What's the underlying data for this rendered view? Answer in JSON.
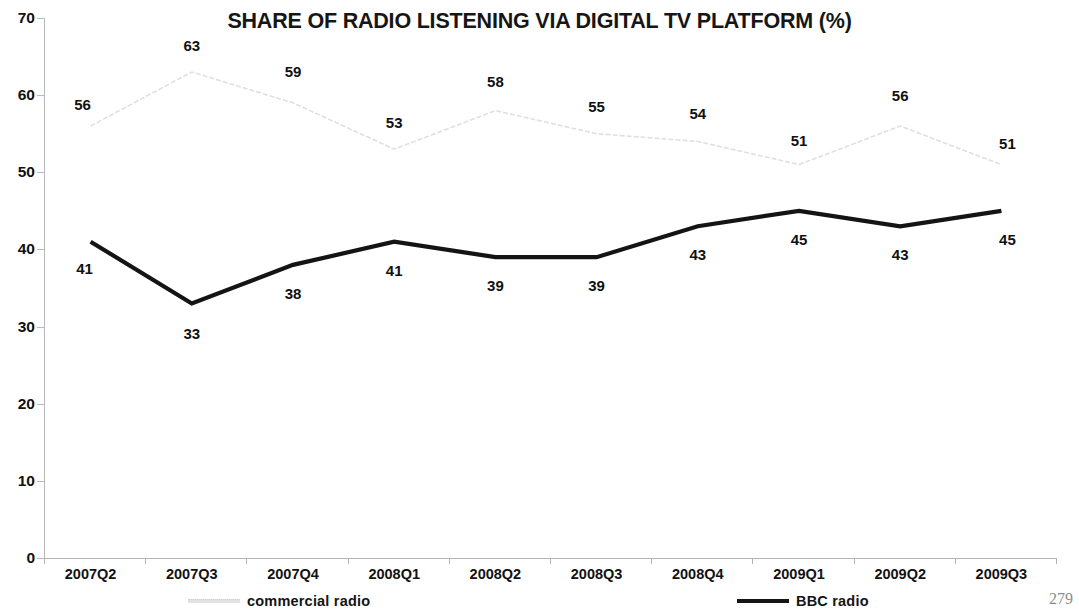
{
  "page_number": "279",
  "legend": {
    "position": "bottom",
    "entries": [
      {
        "label": "commercial radio",
        "style": "dotted-light",
        "color": "#e0e0e0"
      },
      {
        "label": "BBC radio",
        "style": "solid-thick",
        "color": "#141414"
      }
    ]
  },
  "chart_data": {
    "type": "line",
    "title": "SHARE OF RADIO LISTENING VIA DIGITAL TV PLATFORM (%)",
    "xlabel": "",
    "ylabel": "",
    "ylim": [
      0,
      70
    ],
    "yticks": [
      0,
      10,
      20,
      30,
      40,
      50,
      60,
      70
    ],
    "ytick_labels": [
      "0",
      "10",
      "20",
      "30",
      "40",
      "50",
      "60",
      "70"
    ],
    "grid": false,
    "categories": [
      "2007Q2",
      "2007Q3",
      "2007Q4",
      "2008Q1",
      "2008Q2",
      "2008Q3",
      "2008Q4",
      "2009Q1",
      "2009Q2",
      "2009Q3"
    ],
    "series": [
      {
        "name": "commercial radio",
        "color": "#e0e0e0",
        "values": [
          56,
          63,
          59,
          53,
          58,
          55,
          54,
          51,
          56,
          51
        ],
        "label_offsets": [
          {
            "dx": -8,
            "dy": -22
          },
          {
            "dx": 0,
            "dy": -27
          },
          {
            "dx": 0,
            "dy": -32
          },
          {
            "dx": 0,
            "dy": -27
          },
          {
            "dx": 0,
            "dy": -30
          },
          {
            "dx": 0,
            "dy": -28
          },
          {
            "dx": 0,
            "dy": -28
          },
          {
            "dx": 0,
            "dy": -25
          },
          {
            "dx": 0,
            "dy": -31
          },
          {
            "dx": 6,
            "dy": -22
          }
        ]
      },
      {
        "name": "BBC radio",
        "color": "#141414",
        "values": [
          41,
          33,
          38,
          41,
          39,
          39,
          43,
          45,
          43,
          45
        ],
        "label_offsets": [
          {
            "dx": -6,
            "dy": 26
          },
          {
            "dx": 0,
            "dy": 30
          },
          {
            "dx": 0,
            "dy": 28
          },
          {
            "dx": 0,
            "dy": 28
          },
          {
            "dx": 0,
            "dy": 28
          },
          {
            "dx": 0,
            "dy": 28
          },
          {
            "dx": 0,
            "dy": 28
          },
          {
            "dx": 0,
            "dy": 28
          },
          {
            "dx": 0,
            "dy": 28
          },
          {
            "dx": 6,
            "dy": 28
          }
        ]
      }
    ]
  }
}
